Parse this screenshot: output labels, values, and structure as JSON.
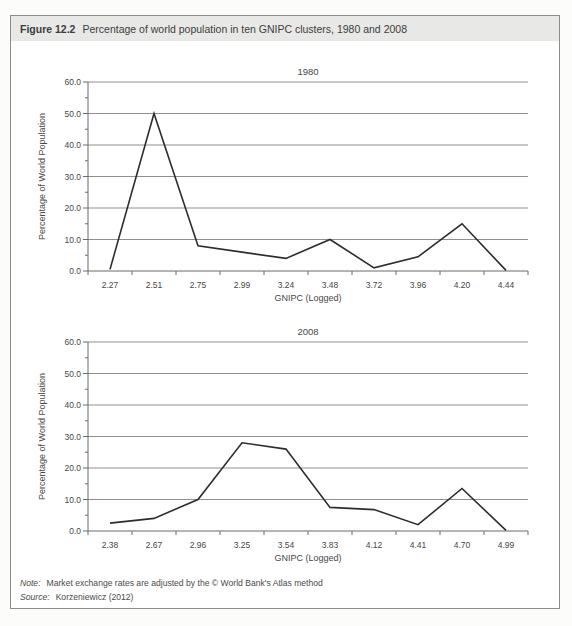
{
  "header": {
    "figure_label": "Figure 12.2",
    "caption": "Percentage of world population in ten GNIPC clusters, 1980 and 2008"
  },
  "chart_data": [
    {
      "type": "line",
      "title": "1980",
      "xlabel": "GNIPC (Logged)",
      "ylabel": "Percentage of World Population",
      "categories": [
        "2.27",
        "2.51",
        "2.75",
        "2.99",
        "3.24",
        "3.48",
        "3.72",
        "3.96",
        "4.20",
        "4.44"
      ],
      "values": [
        0.5,
        50.0,
        8.0,
        6.0,
        4.0,
        10.0,
        1.0,
        4.5,
        15.0,
        0.2
      ],
      "ylim": [
        0,
        60
      ],
      "ytick_step": 10,
      "ytick_labels": [
        "0.0",
        "10.0",
        "20.0",
        "30.0",
        "40.0",
        "50.0",
        "60.0"
      ],
      "grid": true,
      "legend": "none"
    },
    {
      "type": "line",
      "title": "2008",
      "xlabel": "GNIPC (Logged)",
      "ylabel": "Percentage of World Population",
      "categories": [
        "2.38",
        "2.67",
        "2.96",
        "3.25",
        "3.54",
        "3.83",
        "4.12",
        "4.41",
        "4.70",
        "4.99"
      ],
      "values": [
        2.5,
        4.0,
        10.0,
        28.0,
        26.0,
        7.5,
        6.8,
        2.0,
        13.5,
        0.2
      ],
      "ylim": [
        0,
        60
      ],
      "ytick_step": 10,
      "ytick_labels": [
        "0.0",
        "10.0",
        "20.0",
        "30.0",
        "40.0",
        "50.0",
        "60.0"
      ],
      "grid": true,
      "legend": "none"
    }
  ],
  "footer": {
    "note_label": "Note:",
    "note_text": "Market exchange rates are adjusted by the © World Bank's Atlas method",
    "source_label": "Source:",
    "source_text": "Korzeniewicz (2012)"
  },
  "colors": {
    "header_bg": "#e8e8e6",
    "box_border": "#8c8c8c",
    "grid": "#8f8f8f",
    "axis": "#6b6b6b",
    "line": "#2d2d2d",
    "text": "#474747"
  }
}
